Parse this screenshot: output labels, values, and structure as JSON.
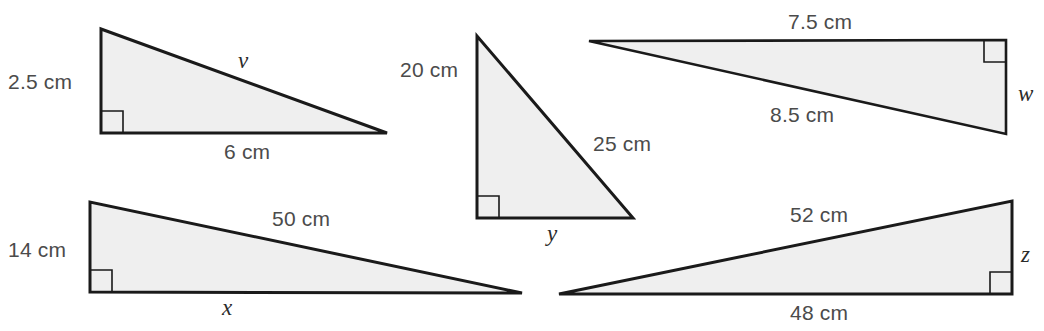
{
  "page": {
    "background_color": "#ffffff",
    "figure_fill_color": "#efefef",
    "figure_stroke_color": "#1a1a1a",
    "measure_label_color": "#4b4b4b",
    "variable_label_color": "#2b2b2b"
  },
  "figures": [
    {
      "id": "triangle-v",
      "unknown": "v",
      "unknown_side": "hypotenuse",
      "right_angle_corner": "bottom-left",
      "labels": {
        "vertical_leg": "2.5 cm",
        "horizontal_leg": "6 cm",
        "hypotenuse": "v"
      }
    },
    {
      "id": "triangle-y",
      "unknown": "y",
      "unknown_side": "horizontal-leg",
      "right_angle_corner": "bottom-left",
      "labels": {
        "vertical_leg": "20 cm",
        "hypotenuse": "25 cm",
        "horizontal_leg": "y"
      }
    },
    {
      "id": "triangle-w",
      "unknown": "w",
      "unknown_side": "vertical-leg",
      "right_angle_corner": "top-right",
      "labels": {
        "horizontal_leg": "7.5 cm",
        "hypotenuse": "8.5 cm",
        "vertical_leg": "w"
      }
    },
    {
      "id": "triangle-x",
      "unknown": "x",
      "unknown_side": "horizontal-leg",
      "right_angle_corner": "bottom-left",
      "labels": {
        "vertical_leg": "14 cm",
        "hypotenuse": "50 cm",
        "horizontal_leg": "x"
      }
    },
    {
      "id": "triangle-z",
      "unknown": "z",
      "unknown_side": "vertical-leg",
      "right_angle_corner": "bottom-right",
      "labels": {
        "hypotenuse": "52 cm",
        "horizontal_leg": "48 cm",
        "vertical_leg": "z"
      }
    }
  ],
  "labels": {
    "t1_vertical": "2.5 cm",
    "t1_horizontal": "6 cm",
    "t1_hypotenuse": "v",
    "t2_vertical": "20 cm",
    "t2_hypotenuse": "25 cm",
    "t2_horizontal": "y",
    "t3_horizontal": "7.5 cm",
    "t3_hypotenuse": "8.5 cm",
    "t3_vertical": "w",
    "t4_vertical": "14 cm",
    "t4_hypotenuse": "50 cm",
    "t4_horizontal": "x",
    "t5_hypotenuse": "52 cm",
    "t5_horizontal": "48 cm",
    "t5_vertical": "z"
  }
}
